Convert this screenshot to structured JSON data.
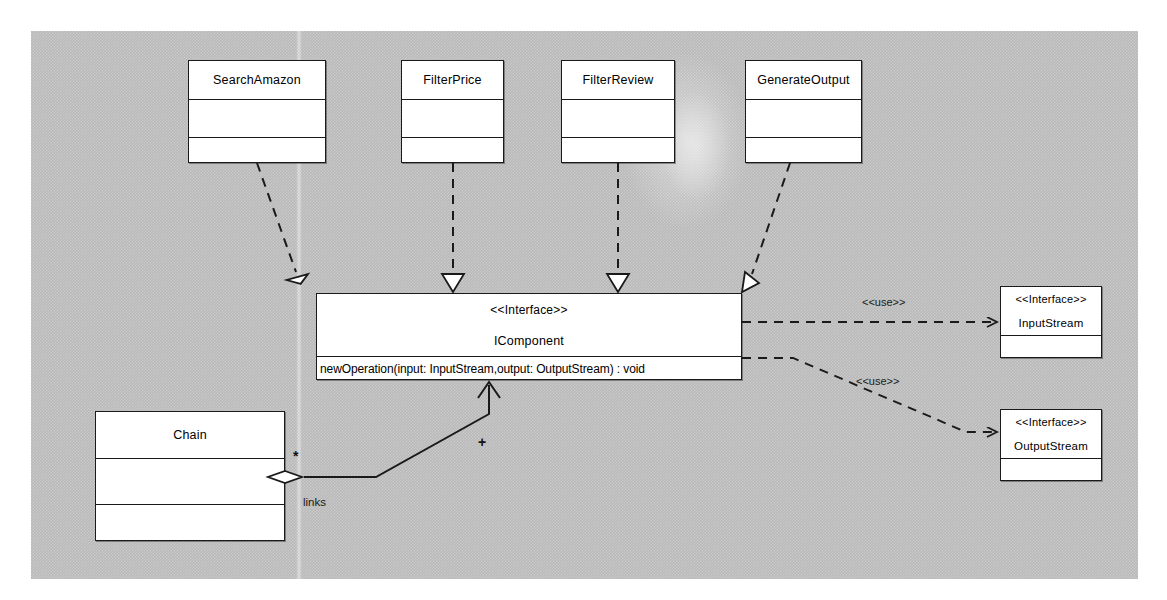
{
  "diagram": {
    "type": "uml-class-diagram",
    "canvas_color": "#b9b9b9",
    "box_fill": "#ffffff",
    "line_color": "#1a1a1a"
  },
  "classes": [
    {
      "id": "search-amazon",
      "name": "SearchAmazon",
      "x": 188,
      "y": 60,
      "w": 138,
      "h": 103,
      "dividers": [
        38,
        76
      ]
    },
    {
      "id": "filter-price",
      "name": "FilterPrice",
      "x": 401,
      "y": 60,
      "w": 103,
      "h": 103,
      "dividers": [
        38,
        76
      ]
    },
    {
      "id": "filter-review",
      "name": "FilterReview",
      "x": 561,
      "y": 60,
      "w": 114,
      "h": 103,
      "dividers": [
        38,
        76
      ]
    },
    {
      "id": "generate-output",
      "name": "GenerateOutput",
      "x": 745,
      "y": 60,
      "w": 117,
      "h": 103,
      "dividers": [
        38,
        76
      ]
    },
    {
      "id": "chain",
      "name": "Chain",
      "x": 95,
      "y": 411,
      "w": 190,
      "h": 130,
      "dividers": [
        46,
        92
      ]
    }
  ],
  "interfaces": [
    {
      "id": "icomponent",
      "stereotype": "<<Interface>>",
      "name": "IComponent",
      "operation": "newOperation(input: InputStream,output: OutputStream) : void",
      "x": 316,
      "y": 293,
      "w": 426,
      "h": 87
    },
    {
      "id": "input-stream",
      "stereotype": "<<Interface>>",
      "name": "InputStream",
      "x": 1000,
      "y": 286,
      "w": 102,
      "h": 72
    },
    {
      "id": "output-stream",
      "stereotype": "<<Interface>>",
      "name": "OutputStream",
      "x": 1000,
      "y": 409,
      "w": 102,
      "h": 72
    }
  ],
  "relationships": {
    "realizations": [
      {
        "from": "SearchAmazon",
        "to": "IComponent",
        "style": "dashed",
        "arrow": "hollow-triangle"
      },
      {
        "from": "FilterPrice",
        "to": "IComponent",
        "style": "dashed",
        "arrow": "hollow-triangle"
      },
      {
        "from": "FilterReview",
        "to": "IComponent",
        "style": "dashed",
        "arrow": "hollow-triangle"
      },
      {
        "from": "GenerateOutput",
        "to": "IComponent",
        "style": "dashed",
        "arrow": "hollow-triangle"
      }
    ],
    "dependencies": [
      {
        "from": "IComponent",
        "to": "InputStream",
        "label": "<<use>>",
        "style": "dashed",
        "arrow": "open"
      },
      {
        "from": "IComponent",
        "to": "OutputStream",
        "label": "<<use>>",
        "style": "dashed",
        "arrow": "open"
      }
    ],
    "aggregation": {
      "from": "Chain",
      "to": "IComponent",
      "label": "links",
      "source_multiplicity": "*",
      "target_multiplicity": "+",
      "diamond": "hollow",
      "arrow": "open"
    }
  },
  "labels": {
    "use_top": "<<use>>",
    "use_bottom": "<<use>>",
    "links": "links",
    "star": "*",
    "plus": "+"
  }
}
